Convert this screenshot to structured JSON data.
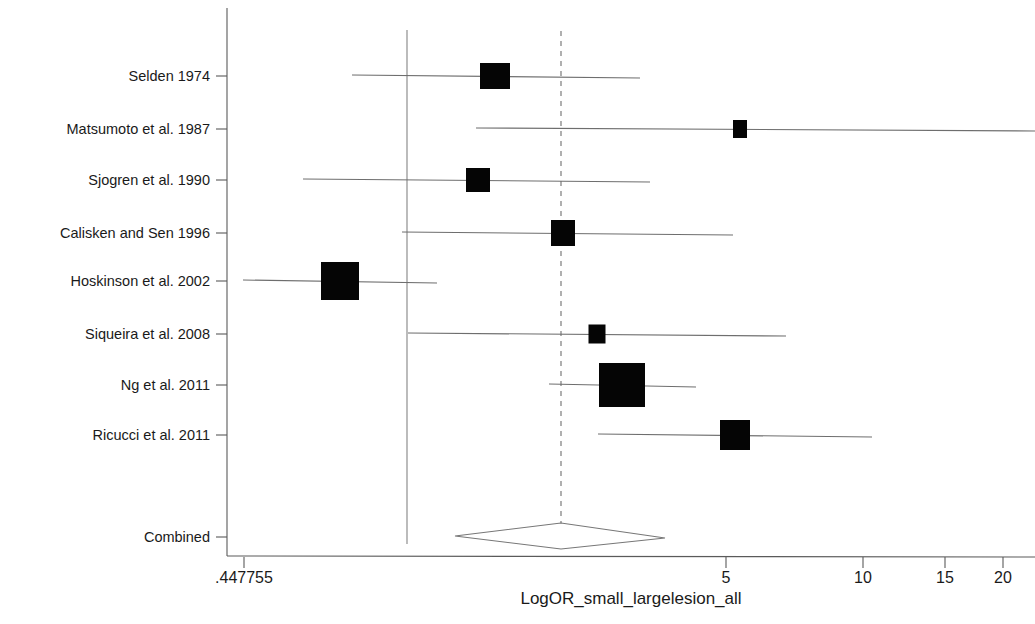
{
  "figure": {
    "type": "forest-plot",
    "background": "#ffffff",
    "marker_color": "#050505",
    "line_color": "#6e6e6e"
  },
  "axis": {
    "x_title": "LogOR_small_largelesion_all",
    "x_scale": "log",
    "x_ticks": [
      {
        "label": ".447755",
        "value": 0.447755,
        "px": 244
      },
      {
        "label": "5",
        "value": 5,
        "px": 726
      },
      {
        "label": "10",
        "value": 10,
        "px": 863
      },
      {
        "label": "15",
        "value": 15,
        "px": 945
      },
      {
        "label": "20",
        "value": 20,
        "px": 1003
      }
    ],
    "x_min_px": 227,
    "x_max_px": 1035,
    "y_top_px": 8,
    "y_bottom_px": 556,
    "null_line_px": 407,
    "pooled_line_px": 561
  },
  "chart_data": {
    "type": "forest",
    "title": "",
    "xlabel": "LogOR_small_largelesion_all",
    "ylabel": "",
    "xscale": "log",
    "xlim": [
      0.447755,
      22
    ],
    "grid": false,
    "legend": "none",
    "null_reference": 1.0,
    "pooled_reference": 2.42,
    "categories": [
      "Selden 1974",
      "Matsumoto et al. 1987",
      "Sjogren et al. 1990",
      "Calisken and Sen 1996",
      "Hoskinson et al. 2002",
      "Siqueira et al. 2008",
      "Ng et al. 2011",
      "Ricucci et al. 2011",
      "Combined"
    ],
    "studies": [
      {
        "label": "Selden 1974",
        "row_px": 76,
        "estimate_px": 495,
        "ci_low_px": 352,
        "ci_high_px": 640,
        "box_w": 30,
        "box_h": 26,
        "estimate": 1.73,
        "ci_low": 0.86,
        "ci_high": 3.32,
        "weight": "medium"
      },
      {
        "label": "Matsumoto et al. 1987",
        "row_px": 129,
        "estimate_px": 740,
        "ci_low_px": 476,
        "ci_high_px": 1035,
        "box_w": 14,
        "box_h": 18,
        "estimate": 5.35,
        "ci_low": 1.57,
        "ci_high": 21.0,
        "weight": "small",
        "ci_truncated_right": true
      },
      {
        "label": "Sjogren et al. 1990",
        "row_px": 180,
        "estimate_px": 478,
        "ci_low_px": 303,
        "ci_high_px": 650,
        "box_w": 24,
        "box_h": 24,
        "estimate": 1.58,
        "ci_low": 0.66,
        "ci_high": 3.53,
        "weight": "medium"
      },
      {
        "label": "Calisken and Sen 1996",
        "row_px": 233,
        "estimate_px": 563,
        "ci_low_px": 402,
        "ci_high_px": 733,
        "box_w": 24,
        "box_h": 26,
        "estimate": 2.45,
        "ci_low": 0.98,
        "ci_high": 5.15,
        "weight": "medium"
      },
      {
        "label": "Hoskinson et al. 2002",
        "row_px": 281,
        "estimate_px": 340,
        "ci_low_px": 243,
        "ci_high_px": 437,
        "box_w": 38,
        "box_h": 38,
        "estimate": 0.73,
        "ci_low": 0.45,
        "ci_high": 1.17,
        "weight": "large"
      },
      {
        "label": "Siqueira et al. 2008",
        "row_px": 334,
        "estimate_px": 597,
        "ci_low_px": 408,
        "ci_high_px": 786,
        "box_w": 17,
        "box_h": 19,
        "estimate": 2.89,
        "ci_low": 1.01,
        "ci_high": 7.15,
        "weight": "small"
      },
      {
        "label": "Ng et al. 2011",
        "row_px": 385,
        "estimate_px": 622,
        "ci_low_px": 549,
        "ci_high_px": 696,
        "box_w": 46,
        "box_h": 44,
        "estimate": 3.26,
        "ci_low": 2.23,
        "ci_high": 4.52,
        "weight": "largest"
      },
      {
        "label": "Ricucci et al. 2011",
        "row_px": 435,
        "estimate_px": 735,
        "ci_low_px": 598,
        "ci_high_px": 872,
        "box_w": 30,
        "box_h": 30,
        "estimate": 5.15,
        "ci_low": 2.9,
        "ci_high": 10.3,
        "weight": "medium"
      }
    ],
    "combined": {
      "label": "Combined",
      "row_px": 537,
      "estimate_px": 561,
      "ci_low_px": 455,
      "ci_high_px": 665,
      "estimate": 2.42,
      "ci_low": 1.61,
      "ci_high": 3.68
    }
  }
}
